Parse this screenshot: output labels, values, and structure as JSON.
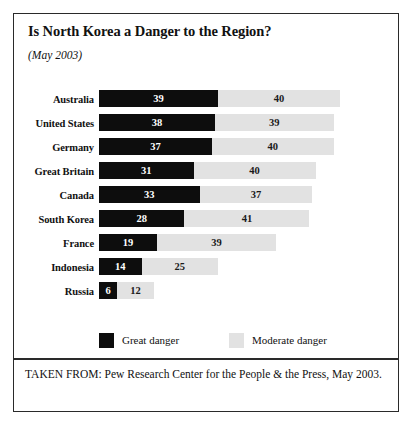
{
  "figure": {
    "title": "Is North Korea a Danger to the Region?",
    "subtitle": "(May 2003)",
    "source": "TAKEN FROM: Pew Research Center for the People & the Press, May 2003."
  },
  "legend": {
    "great": "Great danger",
    "moderate": "Moderate danger"
  },
  "colors": {
    "great_danger": "#0d0d0d",
    "moderate_danger": "#e2e2e2",
    "border": "#2a2a2a",
    "background": "#ffffff"
  },
  "chart_data": {
    "type": "bar",
    "title": "Is North Korea a Danger to the Region?",
    "subtitle": "(May 2003)",
    "orientation": "horizontal",
    "stacked": true,
    "xlabel": "",
    "ylabel": "",
    "grid": false,
    "legend_position": "bottom",
    "axis_visible": false,
    "value_unit": "percent",
    "categories": [
      "Australia",
      "United States",
      "Germany",
      "Great Britain",
      "Canada",
      "South Korea",
      "France",
      "Indonesia",
      "Russia"
    ],
    "series": [
      {
        "name": "Great danger",
        "color": "#0d0d0d",
        "values": [
          39,
          38,
          37,
          31,
          33,
          28,
          19,
          14,
          6
        ]
      },
      {
        "name": "Moderate danger",
        "color": "#e2e2e2",
        "values": [
          40,
          39,
          40,
          40,
          37,
          41,
          39,
          25,
          12
        ]
      }
    ],
    "totals": [
      79,
      77,
      77,
      71,
      70,
      69,
      58,
      39,
      18
    ],
    "xlim": [
      0,
      79
    ],
    "px_per_unit": 3.05
  }
}
